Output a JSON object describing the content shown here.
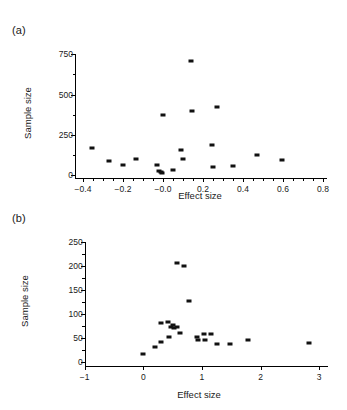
{
  "figure": {
    "panels": [
      {
        "label": "(a)",
        "xlabel": "Effect size",
        "ylabel": "Sample size"
      },
      {
        "label": "(b)",
        "xlabel": "Effect size",
        "ylabel": "Sample size"
      }
    ]
  },
  "chart_data": [
    {
      "type": "scatter",
      "panel": "(a)",
      "title": "",
      "xlabel": "Effect size",
      "ylabel": "Sample size",
      "xlim": [
        -0.45,
        0.82
      ],
      "ylim": [
        -20,
        790
      ],
      "xticks": [
        -0.4,
        -0.2,
        -0.0,
        0.2,
        0.4,
        0.6,
        0.8
      ],
      "xticklabels": [
        "−0.4",
        "−0.2",
        "−0.0",
        "0.2",
        "0.4",
        "0.6",
        "0.8"
      ],
      "yticks": [
        0,
        250,
        500,
        750
      ],
      "yticklabels": [
        "0",
        "250",
        "500",
        "750"
      ],
      "xminorticks": [
        -0.35,
        -0.3,
        -0.25,
        -0.15,
        -0.1,
        -0.05,
        0.05,
        0.1,
        0.15,
        0.25,
        0.3,
        0.35,
        0.45,
        0.5,
        0.55,
        0.65,
        0.7,
        0.75
      ],
      "yminorticks": [
        125,
        375,
        625
      ],
      "grid": false,
      "legend": null,
      "marker": "square",
      "color": "#111111",
      "points": [
        {
          "x": -0.355,
          "y": 168
        },
        {
          "x": -0.272,
          "y": 84
        },
        {
          "x": -0.198,
          "y": 58
        },
        {
          "x": -0.133,
          "y": 97
        },
        {
          "x": -0.03,
          "y": 62
        },
        {
          "x": -0.018,
          "y": 22
        },
        {
          "x": -0.01,
          "y": 15
        },
        {
          "x": -0.004,
          "y": 14
        },
        {
          "x": -0.002,
          "y": 375
        },
        {
          "x": 0.052,
          "y": 31
        },
        {
          "x": 0.09,
          "y": 155
        },
        {
          "x": 0.1,
          "y": 98
        },
        {
          "x": 0.14,
          "y": 712
        },
        {
          "x": 0.145,
          "y": 398
        },
        {
          "x": 0.245,
          "y": 188
        },
        {
          "x": 0.25,
          "y": 48
        },
        {
          "x": 0.268,
          "y": 422
        },
        {
          "x": 0.35,
          "y": 52
        },
        {
          "x": 0.47,
          "y": 125
        },
        {
          "x": 0.597,
          "y": 90
        }
      ]
    },
    {
      "type": "scatter",
      "panel": "(b)",
      "title": "",
      "xlabel": "Effect size",
      "ylabel": "Sample size",
      "xlim": [
        -1.25,
        3.15
      ],
      "ylim": [
        -8,
        262
      ],
      "xticks": [
        -1,
        0,
        1,
        2,
        3
      ],
      "xticklabels": [
        "−1",
        "0",
        "1",
        "2",
        "3"
      ],
      "yticks": [
        0,
        50,
        100,
        150,
        200,
        250
      ],
      "yticklabels": [
        "0",
        "50",
        "100",
        "150",
        "200",
        "250"
      ],
      "xminorticks": [],
      "yminorticks": [
        25,
        75,
        125,
        175,
        225
      ],
      "grid": false,
      "legend": null,
      "marker": "square",
      "color": "#111111",
      "points": [
        {
          "x": 0.0,
          "y": 17
        },
        {
          "x": 0.2,
          "y": 32
        },
        {
          "x": 0.3,
          "y": 41
        },
        {
          "x": 0.31,
          "y": 82
        },
        {
          "x": 0.42,
          "y": 83
        },
        {
          "x": 0.44,
          "y": 52
        },
        {
          "x": 0.48,
          "y": 73
        },
        {
          "x": 0.51,
          "y": 77
        },
        {
          "x": 0.53,
          "y": 70
        },
        {
          "x": 0.57,
          "y": 74
        },
        {
          "x": 0.58,
          "y": 206
        },
        {
          "x": 0.62,
          "y": 60
        },
        {
          "x": 0.7,
          "y": 200
        },
        {
          "x": 0.78,
          "y": 128
        },
        {
          "x": 0.92,
          "y": 52
        },
        {
          "x": 0.93,
          "y": 47
        },
        {
          "x": 1.03,
          "y": 58
        },
        {
          "x": 1.05,
          "y": 47
        },
        {
          "x": 1.16,
          "y": 59
        },
        {
          "x": 1.25,
          "y": 37
        },
        {
          "x": 1.48,
          "y": 38
        },
        {
          "x": 1.78,
          "y": 47
        },
        {
          "x": 2.83,
          "y": 40
        }
      ]
    }
  ]
}
